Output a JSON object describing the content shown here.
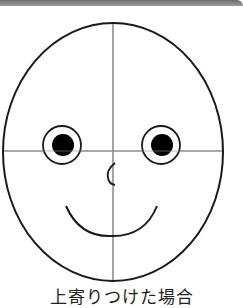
{
  "figure": {
    "caption": "上寄りつけた場合",
    "colors": {
      "outline": "#1a1a1a",
      "guide_lines": "#8c8c8c",
      "pupil": "#000000",
      "background": "#ffffff",
      "top_bar": "#7a7a7a"
    },
    "face": {
      "shape": "oval",
      "guides": [
        "vertical-center-line",
        "horizontal-center-line"
      ],
      "features": [
        "left-eye",
        "right-eye",
        "nose",
        "smile-mouth"
      ]
    }
  }
}
